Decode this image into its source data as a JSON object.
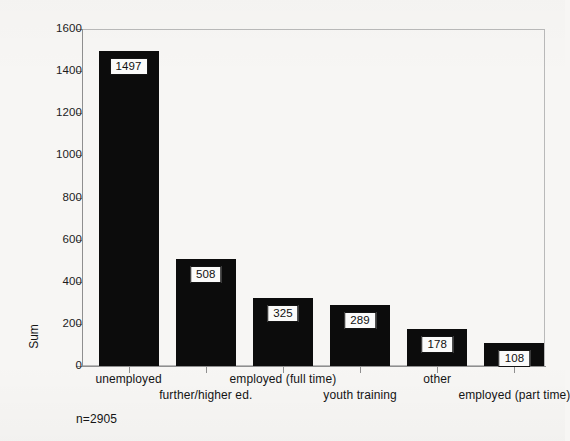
{
  "chart_data": {
    "type": "bar",
    "title": "",
    "subtitle": "",
    "xlabel": "",
    "ylabel": "Sum",
    "categories": [
      "unemployed",
      "further/higher ed.",
      "employed (full time)",
      "youth training",
      "other",
      "employed (part time)"
    ],
    "values": [
      1497,
      508,
      325,
      289,
      178,
      108
    ],
    "value_labels": [
      "1497",
      "508",
      "325",
      "289",
      "178",
      "108"
    ],
    "ylim": [
      0,
      1600
    ],
    "ytick_labels": [
      "0",
      "200",
      "400",
      "600",
      "800",
      "1000",
      "1200",
      "1400",
      "1600"
    ],
    "ytick_values": [
      0,
      200,
      400,
      600,
      800,
      1000,
      1200,
      1400,
      1600
    ],
    "grid": false,
    "legend": "none",
    "annotation": "n=2905",
    "bar_color": "#0c0c0c",
    "label_box_color": "#fbfbfa",
    "axis_color": "#8f8f8f",
    "background_color": "#f7f6f4",
    "xlabel_rows": [
      0,
      1,
      0,
      1,
      0,
      1
    ]
  }
}
